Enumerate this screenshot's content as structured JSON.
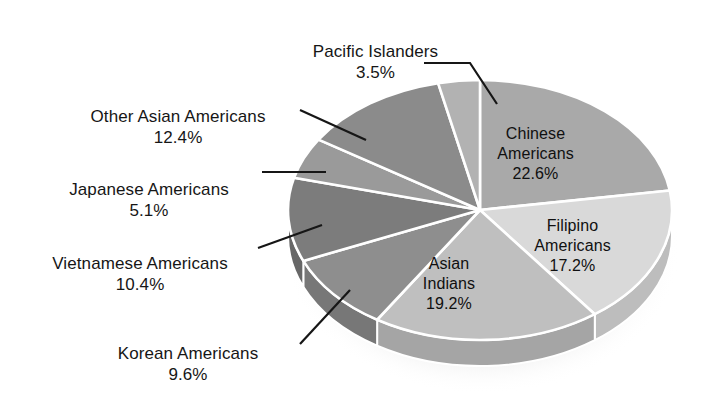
{
  "chart_data": {
    "type": "pie",
    "title": "",
    "subtitle": "",
    "xlabel": "",
    "ylabel": "",
    "legend_position": "none",
    "style": "3d-exploded-pie",
    "units": "percent",
    "categories": [
      "Chinese Americans",
      "Filipino Americans",
      "Asian Indians",
      "Korean Americans",
      "Vietnamese Americans",
      "Japanese Americans",
      "Other Asian Americans",
      "Pacific Islanders"
    ],
    "values": [
      22.6,
      17.2,
      19.2,
      9.6,
      10.4,
      5.1,
      12.4,
      3.5
    ],
    "slices": [
      {
        "label": "Chinese Americans",
        "value": 22.6,
        "pct_text": "22.6%",
        "color": "#a9a9a9",
        "side_color": "#8f8f8f",
        "label_placement": "inside"
      },
      {
        "label": "Filipino Americans",
        "value": 17.2,
        "pct_text": "17.2%",
        "color": "#d9d9d9",
        "side_color": "#bdbdbd",
        "label_placement": "inside"
      },
      {
        "label": "Asian Indians",
        "value": 19.2,
        "pct_text": "19.2%",
        "color": "#bfbfbf",
        "side_color": "#a5a5a5",
        "label_placement": "inside"
      },
      {
        "label": "Korean Americans",
        "value": 9.6,
        "pct_text": "9.6%",
        "color": "#8e8e8e",
        "side_color": "#777777",
        "label_placement": "leader-left"
      },
      {
        "label": "Vietnamese Americans",
        "value": 10.4,
        "pct_text": "10.4%",
        "color": "#7c7c7c",
        "side_color": "#676767",
        "label_placement": "leader-left"
      },
      {
        "label": "Japanese Americans",
        "value": 5.1,
        "pct_text": "5.1%",
        "color": "#9a9a9a",
        "side_color": "#828282",
        "label_placement": "leader-left"
      },
      {
        "label": "Other Asian Americans",
        "value": 12.4,
        "pct_text": "12.4%",
        "color": "#8b8b8b",
        "side_color": "#747474",
        "label_placement": "leader-left"
      },
      {
        "label": "Pacific Islanders",
        "value": 3.5,
        "pct_text": "3.5%",
        "color": "#b2b2b2",
        "side_color": "#989898",
        "label_placement": "leader-top"
      }
    ],
    "total": 100.0,
    "background_color": "#ffffff",
    "divider_color": "#ffffff",
    "text_color": "#161616"
  },
  "labels": {
    "pacific": {
      "name": "Pacific Islanders",
      "pct": "3.5%"
    },
    "other": {
      "name": "Other Asian Americans",
      "pct": "12.4%"
    },
    "japanese": {
      "name": "Japanese Americans",
      "pct": "5.1%"
    },
    "viet": {
      "name": "Vietnamese Americans",
      "pct": "10.4%"
    },
    "korean": {
      "name": "Korean Americans",
      "pct": "9.6%"
    },
    "chinese": {
      "name": "Chinese\nAmericans",
      "pct": "22.6%"
    },
    "filipino": {
      "name": "Filipino\nAmericans",
      "pct": "17.2%"
    },
    "indian": {
      "name": "Asian\nIndians",
      "pct": "19.2%"
    }
  }
}
